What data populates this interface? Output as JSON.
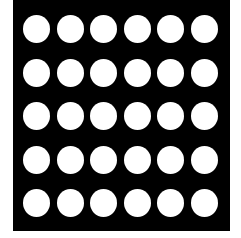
{
  "figure": {
    "rows": 5,
    "columns": 6,
    "colors": {
      "panel": "#000000",
      "holes": "#ffffff",
      "background": "#ffffff"
    }
  }
}
